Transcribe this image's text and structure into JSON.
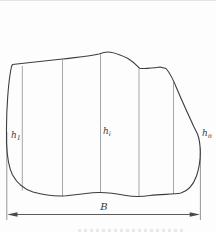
{
  "figure": {
    "type": "diagram",
    "strip_line_count": 5,
    "labels": {
      "ordinate_first": {
        "base": "h",
        "sub": "1"
      },
      "ordinate_middle": {
        "base": "h",
        "sub": "i"
      },
      "ordinate_last": {
        "base": "h",
        "sub": "n"
      },
      "base_width": "B"
    },
    "colors": {
      "outline": "#3d3d3d",
      "strip_line": "#8f8f8f",
      "dimension_line": "#4a4a4a",
      "label_text": "#3a3a3a",
      "background": "#fdfdfd"
    }
  }
}
